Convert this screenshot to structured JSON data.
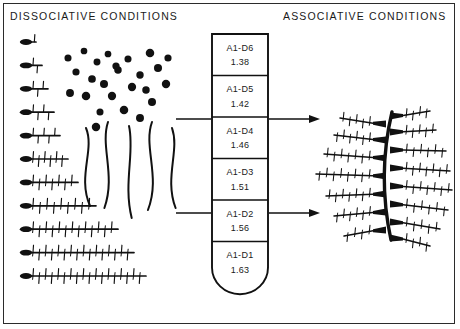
{
  "figure": {
    "headings": {
      "left": "DISSOCIATIVE   CONDITIONS",
      "right": "ASSOCIATIVE   CONDITIONS"
    },
    "border_color": "#2b2b2b",
    "ink_color": "#111111",
    "background_color": "#ffffff"
  },
  "gradient_tube": {
    "name": "density-gradient-tube",
    "shape": "flat-top-round-bottom",
    "fractions": [
      {
        "label": "A1-D6",
        "density": "1.38"
      },
      {
        "label": "A1-D5",
        "density": "1.42"
      },
      {
        "label": "A1-D4",
        "density": "1.46"
      },
      {
        "label": "A1-D3",
        "density": "1.51"
      },
      {
        "label": "A1-D2",
        "density": "1.56"
      },
      {
        "label": "A1-D1",
        "density": "1.63"
      }
    ]
  },
  "dissociative_panel": {
    "subunit_rods": {
      "count": 11,
      "description": "rods with head and increasing side projections",
      "projection_counts": [
        1,
        2,
        3,
        4,
        5,
        6,
        7,
        9,
        13,
        16,
        18,
        20
      ],
      "lengths": [
        14,
        20,
        26,
        32,
        38,
        46,
        56,
        74,
        96,
        112,
        124
      ]
    },
    "monomer_dots": {
      "count": 25,
      "description": "scattered solid globular monomers"
    },
    "smooth_filaments": {
      "count": 5,
      "description": "smooth unbranched wavy backbone filaments"
    }
  },
  "associative_panel": {
    "aggregate": {
      "name": "assembled-filament-aggregate",
      "description": "curved backbone with bristled side arms on both sides",
      "left_arms": 7,
      "right_arms": 8
    }
  },
  "connectors": [
    {
      "name": "connector-upper",
      "from_y": 119,
      "label_level": "A1-D5",
      "has_arrow": true
    },
    {
      "name": "connector-lower",
      "from_y": 213,
      "label_level": "A1-D2",
      "has_arrow": true
    }
  ]
}
